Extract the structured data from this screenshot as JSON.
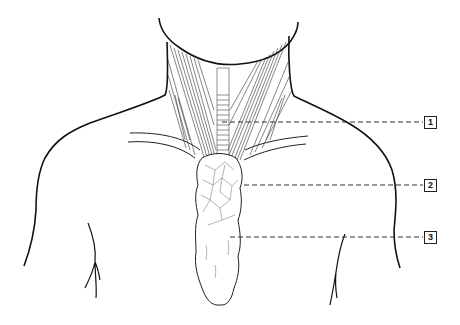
{
  "figure": {
    "type": "anatomical-illustration",
    "labels": [
      {
        "number": "1",
        "y": 122,
        "line_start_x": 222
      },
      {
        "number": "2",
        "y": 185,
        "line_start_x": 244
      },
      {
        "number": "3",
        "y": 237,
        "line_start_x": 230
      }
    ]
  },
  "colors": {
    "outline": "#111111",
    "detail": "#333333",
    "background": "#ffffff"
  }
}
